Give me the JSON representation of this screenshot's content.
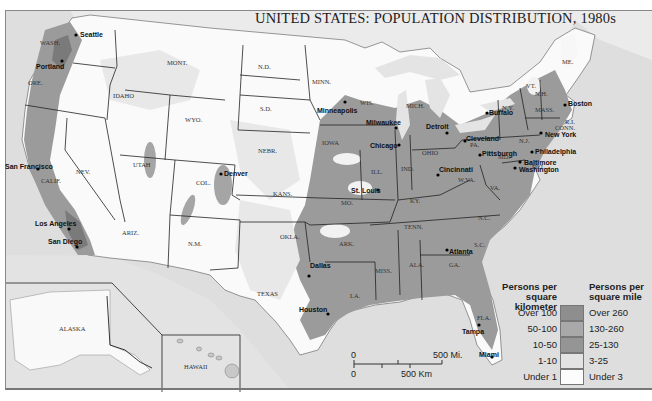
{
  "title": "UNITED STATES: POPULATION DISTRIBUTION, 1980s",
  "colors": {
    "ocean": "#dcdcdc",
    "over_100": "#8e8e8e",
    "50_100": "#a9a9a9",
    "10_50": "#b8b8b8",
    "1_10": "#e6e6e6",
    "under_1": "#fbfbfb",
    "border": "#222222"
  },
  "states": [
    {
      "id": "wash",
      "label": "WASH.",
      "x": 50,
      "y": 43
    },
    {
      "id": "ore",
      "label": "ORE.",
      "x": 38,
      "y": 83
    },
    {
      "id": "idaho",
      "label": "IDAHO",
      "x": 123,
      "y": 96
    },
    {
      "id": "mont",
      "label": "MONT.",
      "x": 177,
      "y": 63
    },
    {
      "id": "wyo",
      "label": "WYO.",
      "x": 195,
      "y": 120
    },
    {
      "id": "nd",
      "label": "N.D.",
      "x": 268,
      "y": 67
    },
    {
      "id": "sd",
      "label": "S.D.",
      "x": 270,
      "y": 109
    },
    {
      "id": "minn",
      "label": "MINN.",
      "x": 322,
      "y": 82
    },
    {
      "id": "wis",
      "label": "WIS.",
      "x": 370,
      "y": 103
    },
    {
      "id": "mich",
      "label": "MICH.",
      "x": 416,
      "y": 106
    },
    {
      "id": "nebr",
      "label": "NEBR.",
      "x": 268,
      "y": 151
    },
    {
      "id": "iowa",
      "label": "IOWA",
      "x": 332,
      "y": 143
    },
    {
      "id": "nev",
      "label": "NEV.",
      "x": 86,
      "y": 172
    },
    {
      "id": "utah",
      "label": "UTAH",
      "x": 143,
      "y": 165
    },
    {
      "id": "col",
      "label": "COL.",
      "x": 206,
      "y": 183
    },
    {
      "id": "kans",
      "label": "KANS.",
      "x": 283,
      "y": 194
    },
    {
      "id": "mo",
      "label": "MO.",
      "x": 351,
      "y": 203
    },
    {
      "id": "ill",
      "label": "ILL.",
      "x": 381,
      "y": 172
    },
    {
      "id": "ind",
      "label": "IND.",
      "x": 411,
      "y": 169
    },
    {
      "id": "ohio",
      "label": "OHIO",
      "x": 432,
      "y": 153
    },
    {
      "id": "ky",
      "label": "KY.",
      "x": 420,
      "y": 201
    },
    {
      "id": "wva",
      "label": "W.VA.",
      "x": 468,
      "y": 180
    },
    {
      "id": "va",
      "label": "VA.",
      "x": 500,
      "y": 188
    },
    {
      "id": "pa",
      "label": "PA.",
      "x": 480,
      "y": 145
    },
    {
      "id": "ny",
      "label": "N.Y.",
      "x": 512,
      "y": 108
    },
    {
      "id": "vt",
      "label": "VT.",
      "x": 536,
      "y": 86
    },
    {
      "id": "nh",
      "label": "N.H.",
      "x": 545,
      "y": 94
    },
    {
      "id": "me",
      "label": "ME.",
      "x": 572,
      "y": 62
    },
    {
      "id": "mass",
      "label": "MASS.",
      "x": 545,
      "y": 110
    },
    {
      "id": "ri",
      "label": "R.I.",
      "x": 575,
      "y": 122
    },
    {
      "id": "conn",
      "label": "CONN.",
      "x": 565,
      "y": 128
    },
    {
      "id": "nj",
      "label": "N.J.",
      "x": 529,
      "y": 141
    },
    {
      "id": "md",
      "label": "MD.",
      "x": 508,
      "y": 157
    },
    {
      "id": "del",
      "label": "DEL.",
      "x": 542,
      "y": 167
    },
    {
      "id": "tenn",
      "label": "TENN.",
      "x": 414,
      "y": 227
    },
    {
      "id": "nc",
      "label": "N.C.",
      "x": 488,
      "y": 218
    },
    {
      "id": "sc",
      "label": "S.C.",
      "x": 484,
      "y": 245
    },
    {
      "id": "ga",
      "label": "GA.",
      "x": 459,
      "y": 265
    },
    {
      "id": "ala",
      "label": "ALA.",
      "x": 419,
      "y": 265
    },
    {
      "id": "miss",
      "label": "MISS.",
      "x": 385,
      "y": 271
    },
    {
      "id": "la",
      "label": "LA.",
      "x": 360,
      "y": 296
    },
    {
      "id": "ark",
      "label": "ARK.",
      "x": 349,
      "y": 244
    },
    {
      "id": "okla",
      "label": "OKLA.",
      "x": 290,
      "y": 237
    },
    {
      "id": "texas",
      "label": "TEXAS",
      "x": 267,
      "y": 294
    },
    {
      "id": "nm",
      "label": "N.M.",
      "x": 198,
      "y": 244
    },
    {
      "id": "ariz",
      "label": "ARIZ.",
      "x": 132,
      "y": 233
    },
    {
      "id": "calif",
      "label": "CALIF.",
      "x": 51,
      "y": 181
    },
    {
      "id": "fla",
      "label": "FLA.",
      "x": 487,
      "y": 318
    },
    {
      "id": "alaska",
      "label": "ALASKA",
      "x": 69,
      "y": 329
    },
    {
      "id": "hawaii",
      "label": "HAWAII",
      "x": 194,
      "y": 367
    }
  ],
  "cities": [
    {
      "name": "Seattle",
      "x": 76,
      "y": 35,
      "dx": 4,
      "dy": -4
    },
    {
      "name": "Portland",
      "x": 62,
      "y": 61,
      "dx": -26,
      "dy": 2
    },
    {
      "name": "San Francisco",
      "x": 38,
      "y": 169,
      "dx": -33,
      "dy": -6
    },
    {
      "name": "Los Angeles",
      "x": 69,
      "y": 229,
      "dx": -34,
      "dy": -9
    },
    {
      "name": "San Diego",
      "x": 77,
      "y": 247,
      "dx": -29,
      "dy": -9
    },
    {
      "name": "Denver",
      "x": 221,
      "y": 174,
      "dx": 3,
      "dy": -4
    },
    {
      "name": "Minneapolis",
      "x": 345,
      "y": 102,
      "dx": -28,
      "dy": 5
    },
    {
      "name": "Milwaukee",
      "x": 396,
      "y": 128,
      "dx": -30,
      "dy": -9
    },
    {
      "name": "Chicago",
      "x": 399,
      "y": 145,
      "dx": -29,
      "dy": -3
    },
    {
      "name": "Detroit",
      "x": 447,
      "y": 133,
      "dx": -21,
      "dy": -10
    },
    {
      "name": "St. Louis",
      "x": 378,
      "y": 190,
      "dx": -27,
      "dy": -3
    },
    {
      "name": "Cincinnati",
      "x": 438,
      "y": 175,
      "dx": 1,
      "dy": -9
    },
    {
      "name": "Cleveland",
      "x": 465,
      "y": 141,
      "dx": 1,
      "dy": -6
    },
    {
      "name": "Pittsburgh",
      "x": 480,
      "y": 155,
      "dx": 2,
      "dy": -5
    },
    {
      "name": "Buffalo",
      "x": 487,
      "y": 113,
      "dx": 2,
      "dy": -4
    },
    {
      "name": "Boston",
      "x": 565,
      "y": 105,
      "dx": 3,
      "dy": -5
    },
    {
      "name": "New York",
      "x": 541,
      "y": 133,
      "dx": 4,
      "dy": -2
    },
    {
      "name": "Philadelphia",
      "x": 532,
      "y": 152,
      "dx": 3,
      "dy": -4
    },
    {
      "name": "Baltimore",
      "x": 520,
      "y": 162,
      "dx": 4,
      "dy": -3
    },
    {
      "name": "Washington",
      "x": 515,
      "y": 168,
      "dx": 4,
      "dy": -2
    },
    {
      "name": "Atlanta",
      "x": 447,
      "y": 250,
      "dx": 2,
      "dy": -2
    },
    {
      "name": "Dallas",
      "x": 309,
      "y": 276,
      "dx": 1,
      "dy": -14
    },
    {
      "name": "Houston",
      "x": 328,
      "y": 314,
      "dx": -29,
      "dy": -8
    },
    {
      "name": "Tampa",
      "x": 479,
      "y": 325,
      "dx": -17,
      "dy": 3
    },
    {
      "name": "Miami",
      "x": 492,
      "y": 357,
      "dx": -13,
      "dy": -6
    }
  ],
  "legend": {
    "left_header": [
      "Persons per",
      "square kilometer"
    ],
    "right_header": [
      "Persons per",
      "square mile"
    ],
    "rows": [
      {
        "km": "Over 100",
        "mi": "Over 260",
        "color": "#8e8e8e"
      },
      {
        "km": "50-100",
        "mi": "130-260",
        "color": "#a9a9a9"
      },
      {
        "km": "10-50",
        "mi": "25-130",
        "color": "#959595"
      },
      {
        "km": "1-10",
        "mi": "3-25",
        "color": "#e3e3e3"
      },
      {
        "km": "Under 1",
        "mi": "Under 3",
        "color": "#fcfcfc"
      }
    ]
  },
  "scale_bar": {
    "miles_zero": "0",
    "miles_label": "500 Mi.",
    "km_zero": "0",
    "km_label": "500 Km"
  }
}
